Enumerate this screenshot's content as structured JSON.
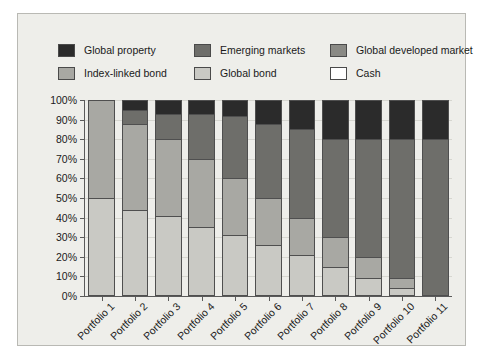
{
  "chart_data": {
    "type": "bar",
    "subtype": "stacked-bar-100-percent",
    "title": "",
    "xlabel": "",
    "ylabel": "",
    "ylim": [
      0,
      100
    ],
    "ytick_labels": [
      "0%",
      "10%",
      "20%",
      "30%",
      "40%",
      "50%",
      "60%",
      "70%",
      "80%",
      "90%",
      "100%"
    ],
    "ytick_values": [
      0,
      10,
      20,
      30,
      40,
      50,
      60,
      70,
      80,
      90,
      100
    ],
    "grid": true,
    "legend_position": "top",
    "categories": [
      "Portfolio 1",
      "Portfolio 2",
      "Portfolio 3",
      "Portfolio 4",
      "Portfolio 5",
      "Portfolio 6",
      "Portfolio 7",
      "Portfolio 8",
      "Portfolio 9",
      "Portfolio 10",
      "Portfolio 11"
    ],
    "stack_order_bottom_to_top": [
      "Cash",
      "Global bond",
      "Index-linked bond",
      "Global developed market",
      "Emerging markets",
      "Global property"
    ],
    "series": [
      {
        "name": "Cash",
        "color": "#ffffff",
        "values": [
          0,
          0,
          0,
          0,
          0,
          0,
          0,
          0,
          0,
          0,
          0
        ]
      },
      {
        "name": "Global bond",
        "color": "#c9c9c4",
        "values": [
          50,
          44,
          41,
          35,
          31,
          26,
          21,
          15,
          9,
          4,
          0
        ]
      },
      {
        "name": "Index-linked bond",
        "color": "#a8a8a3",
        "values": [
          50,
          44,
          39,
          35,
          29,
          24,
          19,
          15,
          11,
          5,
          0
        ]
      },
      {
        "name": "Global developed market",
        "color": "#8a8a85",
        "values": [
          0,
          0,
          0,
          0,
          0,
          0,
          0,
          0,
          0,
          0,
          0
        ]
      },
      {
        "name": "Emerging markets",
        "color": "#6e6e6a",
        "values": [
          0,
          7,
          13,
          23,
          32,
          38,
          45,
          50,
          60,
          71,
          80
        ]
      },
      {
        "name": "Global property",
        "color": "#2b2b2b",
        "values": [
          0,
          5,
          7,
          7,
          8,
          12,
          15,
          20,
          20,
          20,
          20
        ]
      }
    ],
    "legend_entries": [
      {
        "label": "Global property",
        "color": "#2b2b2b"
      },
      {
        "label": "Emerging markets",
        "color": "#6e6e6a"
      },
      {
        "label": "Global developed market",
        "color": "#8a8a85"
      },
      {
        "label": "Index-linked bond",
        "color": "#a8a8a3"
      },
      {
        "label": "Global bond",
        "color": "#c9c9c4"
      },
      {
        "label": "Cash",
        "color": "#ffffff"
      }
    ]
  },
  "colors": {
    "plate_background": "#eeeeea",
    "plate_border": "#b9b9b4",
    "axis": "#5a5a5a",
    "gridline": "#d6d6d0",
    "text": "#1a1a1a",
    "bar_outline": "#4f4f4f"
  }
}
